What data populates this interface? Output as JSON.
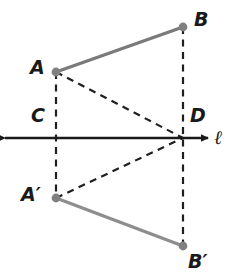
{
  "figure": {
    "width": 230,
    "height": 278,
    "background_color": "#ffffff"
  },
  "colors": {
    "solid_segment": "#7a7a7a",
    "image_segment": "#8e8e8e",
    "dashed_line": "#1f1f1f",
    "axis_line": "#1a1a1a",
    "point_dot": "#808080",
    "label_text": "#1a1a1a"
  },
  "labels": {
    "A": "A",
    "B": "B",
    "C": "C",
    "D": "D",
    "A_prime": "A′",
    "B_prime": "B′",
    "line": "ℓ"
  },
  "points": [
    {
      "name": "A",
      "label": "A",
      "x": 56,
      "y": 72,
      "label_x": 30,
      "label_y": 58,
      "dot": true
    },
    {
      "name": "B",
      "label": "B",
      "x": 183,
      "y": 27,
      "label_x": 194,
      "label_y": 10,
      "dot": true
    },
    {
      "name": "C",
      "label": "C",
      "x": 56,
      "y": 138,
      "label_x": 31,
      "label_y": 106,
      "dot": false
    },
    {
      "name": "D",
      "label": "D",
      "x": 183,
      "y": 138,
      "label_x": 190,
      "label_y": 106,
      "dot": false
    },
    {
      "name": "A-prime",
      "label": "A′",
      "x": 56,
      "y": 198,
      "label_x": 21,
      "label_y": 185,
      "dot": true
    },
    {
      "name": "B-prime",
      "label": "B′",
      "x": 183,
      "y": 246,
      "label_x": 188,
      "label_y": 252,
      "dot": true
    }
  ],
  "segments": [
    {
      "name": "segment-AB",
      "from": "A",
      "to": "B",
      "style": "solid",
      "color": "#7a7a7a",
      "width": 3.4
    },
    {
      "name": "segment-A-prime-B-prime",
      "from": "A-prime",
      "to": "B-prime",
      "style": "solid",
      "color": "#8e8e8e",
      "width": 3.4
    },
    {
      "name": "dashed-A-to-D",
      "from": "A",
      "to": "D",
      "style": "dashed",
      "color": "#1f1f1f",
      "width": 2.2
    },
    {
      "name": "dashed-A-prime-to-D",
      "from": "A-prime",
      "to": "D",
      "style": "dashed",
      "color": "#1f1f1f",
      "width": 2.2
    },
    {
      "name": "dashed-vertical-A-C-A-prime",
      "from": "A",
      "to": "A-prime",
      "style": "dashed",
      "color": "#1f1f1f",
      "width": 2.2
    },
    {
      "name": "dashed-vertical-B-D-B-prime",
      "from": "B",
      "to": "B-prime",
      "style": "dashed",
      "color": "#1f1f1f",
      "width": 2.2
    }
  ],
  "axis": {
    "name": "line-ell",
    "y": 138,
    "x_start": 5,
    "x_end": 208,
    "label": "ℓ",
    "label_x": 214,
    "label_y": 128,
    "arrow_both_ends": true,
    "color": "#1a1a1a",
    "width": 2.4
  },
  "dot_radius": 4.4
}
